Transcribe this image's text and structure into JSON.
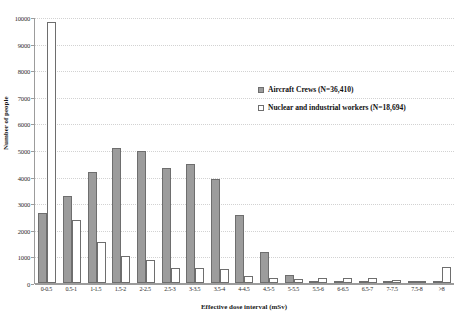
{
  "chart_data": {
    "type": "bar",
    "title": "",
    "xlabel": "Effective dose interval (mSv)",
    "ylabel": "Number of people",
    "grid": true,
    "legend_position": "upper-right-inside",
    "ylim": [
      0,
      10000
    ],
    "ytick_step": 1000,
    "yticks": [
      "0",
      "1000",
      "2000",
      "3000",
      "4000",
      "5000",
      "6000",
      "7000",
      "8000",
      "9000",
      "10000"
    ],
    "categories": [
      "0-0.5",
      "0.5-1",
      "1-1.5",
      "1.5-2",
      "2-2.5",
      "2.5-3",
      "3-3.5",
      "3.5-4",
      "4-4.5",
      "4.5-5",
      "5-5.5",
      "5.5-6",
      "6-6.5",
      "6.5-7",
      "7-7.5",
      "7.5-8",
      ">8"
    ],
    "series": [
      {
        "name": "Aircraft Crews (N=36,410)",
        "color": "#9c9c9c",
        "values": [
          2620,
          3290,
          4180,
          5080,
          4980,
          4310,
          4460,
          3900,
          2560,
          1150,
          310,
          90,
          60,
          50,
          40,
          30,
          20
        ]
      },
      {
        "name": "Nuclear and industrial workers (N=18,694)",
        "color": "#ffffff",
        "values": [
          9800,
          2360,
          1540,
          1030,
          870,
          560,
          550,
          540,
          250,
          190,
          150,
          190,
          180,
          190,
          130,
          90,
          620
        ]
      }
    ]
  },
  "colors": {
    "crews_fill": "#9c9c9c",
    "nuclear_fill": "#ffffff",
    "bar_stroke": "#6e6e6e",
    "axis": "#9c9c9c",
    "grid": "#d2d2d2",
    "text": "#1a1a1a",
    "background": "#ffffff"
  }
}
